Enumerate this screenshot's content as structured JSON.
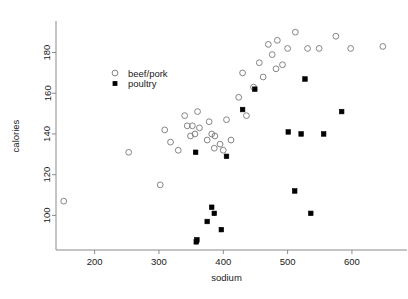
{
  "chart_data": {
    "type": "scatter",
    "title": "",
    "xlabel": "sodium",
    "ylabel": "calories",
    "xlim": [
      140,
      670
    ],
    "ylim": [
      83,
      195
    ],
    "xticks": [
      200,
      300,
      400,
      500,
      600
    ],
    "yticks": [
      100,
      120,
      140,
      160,
      180
    ],
    "grid": false,
    "legend_position": "upper-left-inside",
    "legend": [
      {
        "name": "beef/pork",
        "marker": "open-circle"
      },
      {
        "name": "poultry",
        "marker": "filled-square"
      }
    ],
    "series": [
      {
        "name": "beef/pork",
        "marker": "open-circle",
        "color": "#777777",
        "points": [
          [
            152,
            107
          ],
          [
            253,
            131
          ],
          [
            302,
            115
          ],
          [
            309,
            142
          ],
          [
            318,
            136
          ],
          [
            330,
            132
          ],
          [
            340,
            149
          ],
          [
            344,
            144
          ],
          [
            349,
            139
          ],
          [
            352,
            144
          ],
          [
            356,
            140
          ],
          [
            360,
            151
          ],
          [
            363,
            143
          ],
          [
            375,
            137
          ],
          [
            378,
            146
          ],
          [
            382,
            140
          ],
          [
            386,
            133
          ],
          [
            387,
            139
          ],
          [
            395,
            135
          ],
          [
            400,
            132
          ],
          [
            405,
            147
          ],
          [
            412,
            137
          ],
          [
            424,
            158
          ],
          [
            430,
            170
          ],
          [
            436,
            149
          ],
          [
            447,
            163
          ],
          [
            456,
            175
          ],
          [
            462,
            168
          ],
          [
            470,
            184
          ],
          [
            476,
            179
          ],
          [
            482,
            172
          ],
          [
            484,
            186
          ],
          [
            492,
            174
          ],
          [
            500,
            182
          ],
          [
            512,
            190
          ],
          [
            531,
            182
          ],
          [
            549,
            182
          ],
          [
            575,
            188
          ],
          [
            598,
            182
          ],
          [
            648,
            183
          ]
        ]
      },
      {
        "name": "poultry",
        "marker": "filled-square",
        "color": "#000000",
        "points": [
          [
            357,
            131
          ],
          [
            358,
            87
          ],
          [
            359,
            88
          ],
          [
            375,
            97
          ],
          [
            382,
            104
          ],
          [
            386,
            101
          ],
          [
            397,
            93
          ],
          [
            405,
            129
          ],
          [
            430,
            152
          ],
          [
            449,
            162
          ],
          [
            501,
            141
          ],
          [
            511,
            112
          ],
          [
            521,
            140
          ],
          [
            527,
            167
          ],
          [
            536,
            101
          ],
          [
            556,
            140
          ],
          [
            584,
            151
          ]
        ]
      }
    ]
  },
  "axes": {
    "xlabel": "sodium",
    "ylabel": "calories",
    "xtick_labels": [
      "200",
      "300",
      "400",
      "500",
      "600"
    ],
    "ytick_labels": [
      "100",
      "120",
      "140",
      "160",
      "180"
    ]
  },
  "legend": {
    "entries": [
      {
        "label": "beef/pork"
      },
      {
        "label": "poultry"
      }
    ]
  },
  "style": {
    "axis_color": "#8a8a8a",
    "text_color": "#1a1a1a",
    "open_marker_stroke": "#777777",
    "filled_marker_fill": "#000000",
    "background": "#ffffff"
  }
}
